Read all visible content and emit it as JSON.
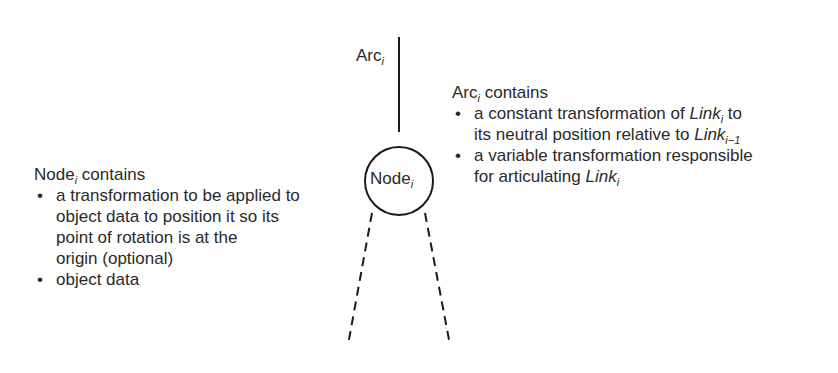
{
  "arc_label": {
    "text": "Arc",
    "subscript": "i"
  },
  "node_label": {
    "text": "Node",
    "subscript": "i"
  },
  "arc_description": {
    "title": "Arc",
    "title_subscript": "i",
    "title_suffix": " contains",
    "items": [
      {
        "line1_prefix": "a constant transformation of ",
        "line1_link": "Link",
        "line1_link_sub": "i",
        "line1_suffix": " to",
        "line2_prefix": "its neutral position relative to ",
        "line2_link": "Link",
        "line2_link_sub": "i−1"
      },
      {
        "line1": "a variable transformation responsible",
        "line2_prefix": "for articulating ",
        "line2_link": "Link",
        "line2_link_sub": "i"
      }
    ]
  },
  "node_description": {
    "title": "Node",
    "title_subscript": "i",
    "title_suffix": " contains",
    "items": [
      {
        "lines": [
          "a transformation to be applied to",
          "object data to position it so its",
          "point of rotation is at the",
          "origin (optional)"
        ]
      },
      {
        "lines": [
          "object data"
        ]
      }
    ]
  },
  "colors": {
    "stroke": "#1a1a1a",
    "text": "#2a2a2a",
    "background": "#ffffff"
  }
}
